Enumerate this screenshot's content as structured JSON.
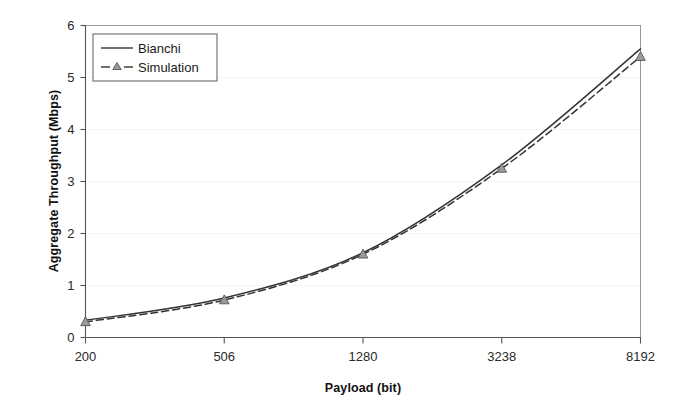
{
  "chart_data": {
    "type": "line",
    "title": "",
    "subtitle": "",
    "xlabel": "Payload (bit)",
    "ylabel": "Aggregate Throughput (Mbps)",
    "x_is_categorical": true,
    "categories": [
      "200",
      "506",
      "1280",
      "3238",
      "8192"
    ],
    "x_tick_labels": [
      "200",
      "506",
      "1280",
      "3238",
      "8192"
    ],
    "y_tick_labels": [
      "0",
      "1",
      "2",
      "3",
      "4",
      "5",
      "6"
    ],
    "y_ticks": [
      0,
      1,
      2,
      3,
      4,
      5,
      6
    ],
    "ylim": [
      0,
      6
    ],
    "grid": "horizontal-dotted-faint",
    "legend_position": "top-left-inside",
    "series": [
      {
        "name": "Bianchi",
        "style": "solid",
        "marker": "none",
        "color": "#333333",
        "values": [
          0.33,
          0.76,
          1.63,
          3.32,
          5.55
        ]
      },
      {
        "name": "Simulation",
        "style": "dashed",
        "marker": "triangle",
        "color": "#333333",
        "values": [
          0.3,
          0.72,
          1.6,
          3.25,
          5.4
        ]
      }
    ],
    "annotations": []
  },
  "legend": {
    "entries": [
      {
        "label": "Bianchi",
        "sample": "solid-line-sample"
      },
      {
        "label": "Simulation",
        "sample": "dashed-line-triangle-sample"
      }
    ]
  },
  "colors": {
    "axis": "#555555",
    "series_line": "#333333",
    "marker_fill": "#9a9a9a",
    "marker_stroke": "#555555",
    "gridline": "#dcdcdc",
    "background": "#ffffff",
    "text": "#1a1a1a"
  }
}
